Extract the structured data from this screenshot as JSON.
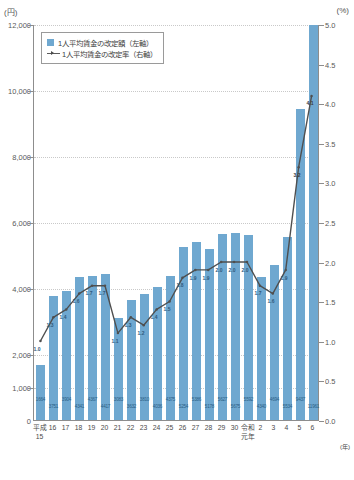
{
  "axes": {
    "left_unit": "(円)",
    "right_unit": "(%)",
    "left_ticks": [
      "12,000",
      "10,000",
      "8,000",
      "6,000",
      "4,000",
      "2,000",
      "1,000",
      "0"
    ],
    "right_ticks": [
      "5.0",
      "4.5",
      "4.0",
      "3.5",
      "3.0",
      "2.5",
      "2.0",
      "1.5",
      "1.0",
      "0.5",
      "0.0"
    ],
    "x_unit": "(年)"
  },
  "legend": {
    "bar_label": "1人平均賃金の改定額（左軸）",
    "line_label": "1人平均賃金の改定率（右軸）",
    "bar_icon": "square-swatch-icon",
    "line_icon": "line-marker-icon"
  },
  "chart_data": {
    "type": "bar",
    "title": "",
    "subtitle": "",
    "xlabel": "(年)",
    "ylabel": "(円)",
    "y2label": "(%)",
    "ylim": [
      0,
      12000
    ],
    "y2lim": [
      0,
      5.0
    ],
    "grid": true,
    "legend_position": "top-left",
    "categories": [
      "平成15",
      "16",
      "17",
      "18",
      "19",
      "20",
      "21",
      "22",
      "23",
      "24",
      "25",
      "26",
      "27",
      "28",
      "29",
      "30",
      "令和元年",
      "2",
      "3",
      "4",
      "5",
      "6"
    ],
    "category_lines": [
      [
        "平成",
        "15"
      ],
      [
        "16",
        ""
      ],
      [
        "17",
        ""
      ],
      [
        "18",
        ""
      ],
      [
        "19",
        ""
      ],
      [
        "20",
        ""
      ],
      [
        "21",
        ""
      ],
      [
        "22",
        ""
      ],
      [
        "23",
        ""
      ],
      [
        "24",
        ""
      ],
      [
        "25",
        ""
      ],
      [
        "26",
        ""
      ],
      [
        "27",
        ""
      ],
      [
        "28",
        ""
      ],
      [
        "29",
        ""
      ],
      [
        "30",
        ""
      ],
      [
        "令和",
        "元年"
      ],
      [
        "2",
        ""
      ],
      [
        "3",
        ""
      ],
      [
        "4",
        ""
      ],
      [
        "5",
        ""
      ],
      [
        "6",
        ""
      ]
    ],
    "series": [
      {
        "name": "1人平均賃金の改定額（左軸）",
        "axis": "left",
        "type": "bar",
        "unit": "円",
        "color": "#6fa8d0",
        "values": [
          1664,
          3751,
          3904,
          4341,
          4367,
          4417,
          3083,
          3632,
          3810,
          4036,
          4375,
          5254,
          5386,
          5178,
          5627,
          5675,
          5592,
          4340,
          4694,
          5534,
          9437,
          11961
        ],
        "labels": [
          "1664",
          "3751",
          "3904",
          "4341",
          "4367",
          "4417",
          "3083",
          "3632",
          "3810",
          "4036",
          "4375",
          "5254",
          "5386",
          "5178",
          "5627",
          "5675",
          "5592",
          "4340",
          "4694",
          "5534",
          "9437",
          "11961"
        ]
      },
      {
        "name": "1人平均賃金の改定率（右軸）",
        "axis": "right",
        "type": "line",
        "unit": "%",
        "color": "#4f4f4f",
        "values": [
          1.0,
          1.3,
          1.4,
          1.6,
          1.7,
          1.7,
          1.1,
          1.3,
          1.2,
          1.4,
          1.5,
          1.8,
          1.9,
          1.9,
          2.0,
          2.0,
          2.0,
          1.7,
          1.6,
          1.9,
          3.2,
          4.1
        ],
        "labels": [
          "1.0",
          "1.3",
          "1.4",
          "1.6",
          "1.7",
          "1.7",
          "1.1",
          "1.3",
          "1.2",
          "1.4",
          "1.5",
          "1.8",
          "1.9",
          "1.9",
          "2.0",
          "2.0",
          "2.0",
          "1.7",
          "1.6",
          "1.9",
          "3.2",
          "4.1"
        ]
      }
    ]
  },
  "colors": {
    "bar": "#6fa8d0",
    "line": "#4f4f4f",
    "grid": "#c9c9c9",
    "axis": "#8d8d8d",
    "bar_label_text": "#2d5f86"
  }
}
